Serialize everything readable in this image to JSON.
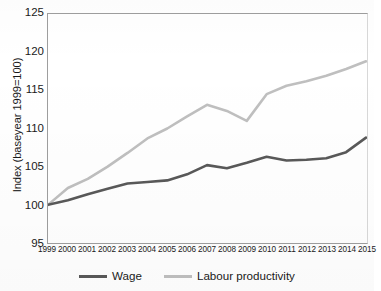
{
  "chart_data": {
    "type": "line",
    "title": "",
    "xlabel": "",
    "ylabel": "Index (baseyear 1999=100)",
    "categories": [
      "1999",
      "2000",
      "2001",
      "2002",
      "2003",
      "2004",
      "2005",
      "2006",
      "2007",
      "2008",
      "2009",
      "2010",
      "2011",
      "2012",
      "2013",
      "2014",
      "2015"
    ],
    "x": [
      1999,
      2000,
      2001,
      2002,
      2003,
      2004,
      2005,
      2006,
      2007,
      2008,
      2009,
      2010,
      2011,
      2012,
      2013,
      2014,
      2015
    ],
    "ylim": [
      95,
      125
    ],
    "yticks": [
      95,
      100,
      105,
      110,
      115,
      120,
      125
    ],
    "grid": false,
    "legend_position": "bottom",
    "series": [
      {
        "name": "Wage",
        "color": "#595959",
        "values": [
          100.0,
          100.6,
          101.4,
          102.1,
          102.8,
          103.0,
          103.2,
          104.0,
          105.2,
          104.8,
          105.5,
          106.3,
          105.8,
          105.9,
          106.1,
          106.9,
          108.8
        ]
      },
      {
        "name": "Labour productivity",
        "color": "#bfbfbf",
        "values": [
          100.0,
          102.2,
          103.4,
          105.0,
          106.8,
          108.7,
          110.0,
          111.6,
          113.1,
          112.3,
          111.0,
          114.5,
          115.6,
          116.2,
          116.9,
          117.8,
          118.8
        ]
      }
    ]
  },
  "axis": {
    "y_title": "Index (baseyear 1999=100)",
    "y_tick_labels": [
      "125",
      "120",
      "115",
      "110",
      "105",
      "100",
      "95"
    ],
    "x_tick_labels": [
      "1999",
      "2000",
      "2001",
      "2002",
      "2003",
      "2004",
      "2005",
      "2006",
      "2007",
      "2008",
      "2009",
      "2010",
      "2011",
      "2012",
      "2013",
      "2014",
      "2015"
    ]
  },
  "legend": {
    "items": [
      {
        "label": "Wage",
        "color": "#595959"
      },
      {
        "label": "Labour productivity",
        "color": "#bfbfbf"
      }
    ]
  },
  "colors": {
    "wage": "#595959",
    "productivity": "#bfbfbf",
    "axis": "#9e9e9e",
    "text": "#1a1a1a",
    "background": "#ffffff"
  }
}
